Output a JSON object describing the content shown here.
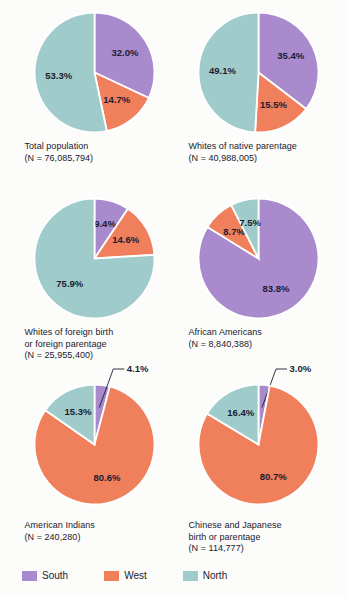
{
  "chart_data": {
    "type": "pie",
    "title": "",
    "legend_position": "bottom",
    "categories": [
      "South",
      "West",
      "North"
    ],
    "colors": {
      "South": "#a98bcd",
      "West": "#f07f5c",
      "North": "#9fccca"
    },
    "charts": [
      {
        "id": "total-population",
        "caption_lines": [
          "Total population",
          "(N = 76,085,794)"
        ],
        "values": [
          32.0,
          14.7,
          53.3
        ],
        "labels": [
          "32.0%",
          "14.7%",
          "53.3%"
        ],
        "callout": null
      },
      {
        "id": "whites-native-parentage",
        "caption_lines": [
          "Whites of native parentage",
          "(N = 40,988,005)"
        ],
        "values": [
          35.4,
          15.5,
          49.1
        ],
        "labels": [
          "35.4%",
          "15.5%",
          "49.1%"
        ],
        "callout": null
      },
      {
        "id": "whites-foreign-birth-parentage",
        "caption_lines": [
          "Whites of foreign birth",
          "or foreign parentage",
          "(N = 25,955,400)"
        ],
        "values": [
          9.4,
          14.6,
          75.9
        ],
        "labels": [
          "9.4%",
          "14.6%",
          "75.9%"
        ],
        "callout": null
      },
      {
        "id": "african-americans",
        "caption_lines": [
          "African Americans",
          "(N = 8,840,388)"
        ],
        "values": [
          83.8,
          8.7,
          7.5
        ],
        "labels": [
          "83.8%",
          "8.7%",
          "7.5%"
        ],
        "callout": null
      },
      {
        "id": "american-indians",
        "caption_lines": [
          "American Indians",
          "(N = 240,280)"
        ],
        "values": [
          4.1,
          80.6,
          15.3
        ],
        "labels": [
          "4.1%",
          "80.6%",
          "15.3%"
        ],
        "callout": {
          "series": "South",
          "text": "4.1%"
        }
      },
      {
        "id": "chinese-japanese-birth-parentage",
        "caption_lines": [
          "Chinese and Japanese",
          "birth or parentage",
          "(N = 114,777)"
        ],
        "values": [
          3.0,
          80.7,
          16.4
        ],
        "labels": [
          "3.0%",
          "80.7%",
          "16.4%"
        ],
        "callout": {
          "series": "South",
          "text": "3.0%"
        }
      }
    ]
  },
  "legend": {
    "items": [
      {
        "label": "South",
        "color": "#a98bcd"
      },
      {
        "label": "West",
        "color": "#f07f5c"
      },
      {
        "label": "North",
        "color": "#9fccca"
      }
    ]
  }
}
